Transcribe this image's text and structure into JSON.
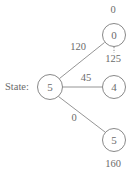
{
  "diagram": {
    "kind": "state-transition-tree",
    "stroke_color": "#7a7a7a",
    "text_color": "#6b6b6b",
    "background": "#ffffff",
    "state_prefix_label": "State:",
    "root": {
      "id": "root",
      "node_text": "5",
      "cx": 50,
      "cy": 87,
      "r": 12.5
    },
    "children": [
      {
        "id": "child-top",
        "node_text": "0",
        "cx": 114,
        "cy": 35,
        "r": 11.5,
        "edge_label": "120",
        "edge_label_x": 78,
        "edge_label_y": 47,
        "top_value": "0",
        "top_value_x": 113,
        "top_value_y": 10,
        "bottom_value": "125",
        "bottom_value_x": 113,
        "bottom_value_y": 59,
        "has_dotted_tick": true
      },
      {
        "id": "child-middle",
        "node_text": "4",
        "cx": 114,
        "cy": 87,
        "r": 11.5,
        "edge_label": "45",
        "edge_label_x": 86,
        "edge_label_y": 78,
        "top_value": null,
        "bottom_value": null,
        "has_dotted_tick": false
      },
      {
        "id": "child-bottom",
        "node_text": "5",
        "cx": 114,
        "cy": 140,
        "r": 11.5,
        "edge_label": "0",
        "edge_label_x": 74,
        "edge_label_y": 118,
        "top_value": null,
        "bottom_value": "160",
        "bottom_value_x": 113,
        "bottom_value_y": 164,
        "has_dotted_tick": false
      }
    ],
    "state_prefix_x": 5,
    "state_prefix_y": 87
  }
}
